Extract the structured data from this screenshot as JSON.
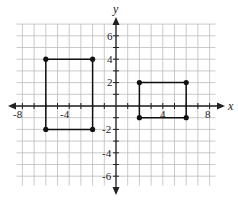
{
  "chart_data": {
    "type": "scatter",
    "title": "",
    "xlabel": "x",
    "ylabel": "y",
    "xlim": [
      -8.5,
      8.5
    ],
    "ylim": [
      -6.8,
      7
    ],
    "grid": true,
    "x_ticks": [
      -8,
      -4,
      4,
      8
    ],
    "y_ticks": [
      6,
      4,
      2,
      -2,
      -4,
      -6
    ],
    "series": [
      {
        "name": "Rectangle A",
        "shape": "rectangle",
        "points": [
          [
            -6,
            4
          ],
          [
            -2,
            4
          ],
          [
            -2,
            -2
          ],
          [
            -6,
            -2
          ]
        ]
      },
      {
        "name": "Rectangle B",
        "shape": "rectangle",
        "points": [
          [
            2,
            2
          ],
          [
            6,
            2
          ],
          [
            6,
            -1
          ],
          [
            2,
            -1
          ]
        ]
      }
    ]
  },
  "labels": {
    "x_axis": "x",
    "y_axis": "y",
    "xt": [
      "-8",
      "-4",
      "4",
      "8"
    ],
    "yt": [
      "6",
      "4",
      "2",
      "-2",
      "-4",
      "-6"
    ]
  },
  "colors": {
    "grid": "#bdbdbd",
    "axis": "#222222",
    "shape": "#111111"
  }
}
